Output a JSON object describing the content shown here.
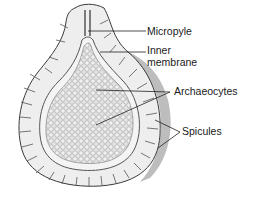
{
  "diagram": {
    "labels": {
      "micropyle": "Micropyle",
      "inner_membrane_line1": "Inner",
      "inner_membrane_line2": "membrane",
      "archaeocytes": "Archaeocytes",
      "spicules": "Spicules"
    },
    "colors": {
      "outline": "#3a3a3a",
      "outer_layer": "#e9e9e9",
      "inner_mass": "#d4d4d4",
      "shadow": "#9a9a9a",
      "leader_line": "#222222"
    }
  }
}
